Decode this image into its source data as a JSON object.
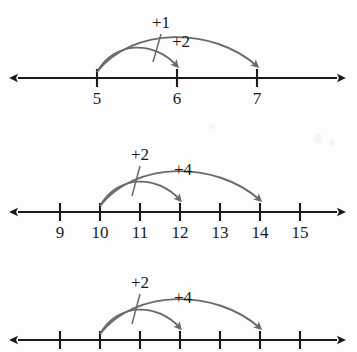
{
  "figure": {
    "background_color": "#fdfdfd",
    "axis_color": "#1a1a1a",
    "arc_color": "#6b6b6b",
    "label_color": "#1a1a1a"
  },
  "chart_data": {
    "type": "line",
    "xlabel": "",
    "ylabel": "",
    "grid": false,
    "legend": "none",
    "number_lines": [
      {
        "id": "number-line-1",
        "axis_y": 78,
        "axis_x_start": 18,
        "axis_x_end": 337,
        "tick_spacing_px": 80,
        "ticks": [
          {
            "label": "5",
            "x": 97
          },
          {
            "label": "6",
            "x": 177
          },
          {
            "label": "7",
            "x": 257
          }
        ],
        "tick_labels_visible": true,
        "jumps": [
          {
            "label": "+1",
            "from": 5,
            "to": 6,
            "from_x": 97,
            "to_x": 177,
            "arc_height": 32,
            "label_x": 152,
            "label_y": 14,
            "leader": true
          },
          {
            "label": "+2",
            "from": 5,
            "to": 7,
            "from_x": 97,
            "to_x": 257,
            "arc_height": 46,
            "label_x": 172,
            "label_y": 33,
            "leader": false
          }
        ]
      },
      {
        "id": "number-line-2",
        "axis_y": 212,
        "axis_x_start": 18,
        "axis_x_end": 337,
        "tick_spacing_px": 40,
        "ticks": [
          {
            "label": "9",
            "x": 60
          },
          {
            "label": "10",
            "x": 100
          },
          {
            "label": "11",
            "x": 140
          },
          {
            "label": "12",
            "x": 180
          },
          {
            "label": "13",
            "x": 220
          },
          {
            "label": "14",
            "x": 260
          },
          {
            "label": "15",
            "x": 300
          }
        ],
        "tick_labels_visible": true,
        "jumps": [
          {
            "label": "+2",
            "from": 10,
            "to": 12,
            "from_x": 100,
            "to_x": 180,
            "arc_height": 32,
            "label_x": 131,
            "label_y": 146,
            "leader": true
          },
          {
            "label": "+4",
            "from": 10,
            "to": 14,
            "from_x": 100,
            "to_x": 260,
            "arc_height": 46,
            "label_x": 174,
            "label_y": 161,
            "leader": false
          }
        ]
      },
      {
        "id": "number-line-3",
        "axis_y": 340,
        "axis_x_start": 18,
        "axis_x_end": 337,
        "tick_spacing_px": 40,
        "ticks": [
          {
            "label": "",
            "x": 60
          },
          {
            "label": "",
            "x": 100
          },
          {
            "label": "",
            "x": 140
          },
          {
            "label": "",
            "x": 180
          },
          {
            "label": "",
            "x": 220
          },
          {
            "label": "",
            "x": 260
          },
          {
            "label": "",
            "x": 300
          }
        ],
        "tick_labels_visible": false,
        "jumps": [
          {
            "label": "+2",
            "from": 10,
            "to": 12,
            "from_x": 100,
            "to_x": 180,
            "arc_height": 32,
            "label_x": 131,
            "label_y": 274,
            "leader": true
          },
          {
            "label": "+4",
            "from": 10,
            "to": 14,
            "from_x": 100,
            "to_x": 260,
            "arc_height": 46,
            "label_x": 174,
            "label_y": 289,
            "leader": false
          }
        ]
      }
    ]
  }
}
